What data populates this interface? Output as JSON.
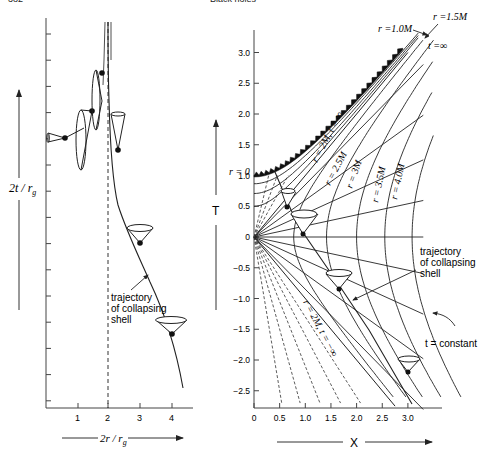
{
  "header": {
    "page_number": "382",
    "running_title": "Black holes"
  },
  "left_panel": {
    "y_axis_label": "2t / r_g",
    "y_axis_label_main": "2t / r",
    "y_axis_label_sub": "g",
    "x_axis_label_main": "2r / r",
    "x_axis_label_sub": "g",
    "x_ticks": [
      "1",
      "2",
      "3",
      "4"
    ],
    "horizon_marker": "2r/r_g = 2 (dashed horizon)",
    "annotation": [
      "trajectory",
      "of collapsing",
      "shell"
    ]
  },
  "right_panel": {
    "y_axis_label": "T",
    "x_axis_label": "X",
    "y_ticks": [
      "3.0",
      "2.5",
      "2.0",
      "1.5",
      "1.0",
      "0.5",
      "0",
      "−0.5",
      "−1.0",
      "−1.5",
      "−2.0",
      "−2.5"
    ],
    "x_ticks": [
      "0",
      "0.5",
      "1.0",
      "1.5",
      "2.0",
      "2.5",
      "3.0"
    ],
    "labels": {
      "r_1_0M": "r  =1.0M",
      "r_1_5M": "r  =1.5M",
      "t_inf": "t  =∞",
      "r_0": "r  =  0",
      "r_2M_t_inf": "r = 2M, t = ∞",
      "r_2_5M": "r = 2.5M",
      "r_3M": "r = 3M",
      "r_3_5M": "r = 3.5M",
      "r_4_0M": "r = 4.0M",
      "r_2M_t_neg_inf": "r = 2M, t = −∞",
      "t_constant": "t = constant"
    },
    "annotation": [
      "trajectory",
      "of collapsing",
      "shell"
    ]
  }
}
